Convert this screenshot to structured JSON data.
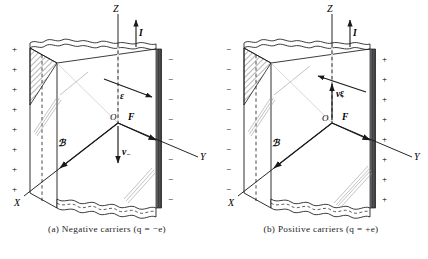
{
  "figure": {
    "kind": "hall-effect-diagram",
    "background": "#ffffff",
    "ink": "#1a1a1a",
    "panels": [
      {
        "id": "a",
        "caption": "(a)  Negative  carriers  (q  =  −e)",
        "caption_label": "(a)",
        "caption_text": "Negative carriers",
        "caption_formula": "(q = −e)",
        "axes": {
          "x": "X",
          "y": "Y",
          "z": "Z",
          "origin": "O"
        },
        "vectors": [
          {
            "name": "current",
            "label": "I",
            "direction": "up"
          },
          {
            "name": "electric-field",
            "label": "ε",
            "direction": "right-down"
          },
          {
            "name": "force",
            "label": "F",
            "direction": "right"
          },
          {
            "name": "magnetic-field",
            "label": "ℬ",
            "direction": "down-left"
          },
          {
            "name": "drift-velocity",
            "label": "v",
            "subscript": "−",
            "direction": "down"
          }
        ],
        "left_face_charge": "+",
        "right_face_charge": "−",
        "left_signs": [
          "+",
          "+",
          "+",
          "+",
          "+",
          "+",
          "+",
          "+"
        ],
        "right_signs": [
          "−",
          "−",
          "−",
          "−",
          "−",
          "−",
          "−",
          "−"
        ]
      },
      {
        "id": "b",
        "caption": "(b)  Positive  carriers  (q  =  +e)",
        "caption_label": "(b)",
        "caption_text": "Positive carriers",
        "caption_formula": "(q = +e)",
        "axes": {
          "x": "X",
          "y": "Y",
          "z": "Z",
          "origin": "O"
        },
        "vectors": [
          {
            "name": "current",
            "label": "I",
            "direction": "up"
          },
          {
            "name": "electric-field",
            "label": "ε",
            "direction": "left-up"
          },
          {
            "name": "force",
            "label": "F",
            "direction": "right"
          },
          {
            "name": "magnetic-field",
            "label": "ℬ",
            "direction": "down-left"
          },
          {
            "name": "drift-velocity",
            "label": "v",
            "subscript": "+",
            "direction": "up"
          }
        ],
        "left_face_charge": "−",
        "right_face_charge": "+",
        "left_signs": [
          "−",
          "−",
          "−",
          "−",
          "−",
          "−",
          "−",
          "−"
        ],
        "right_signs": [
          "+",
          "+",
          "+",
          "+",
          "+",
          "+",
          "+",
          "+"
        ]
      }
    ]
  }
}
